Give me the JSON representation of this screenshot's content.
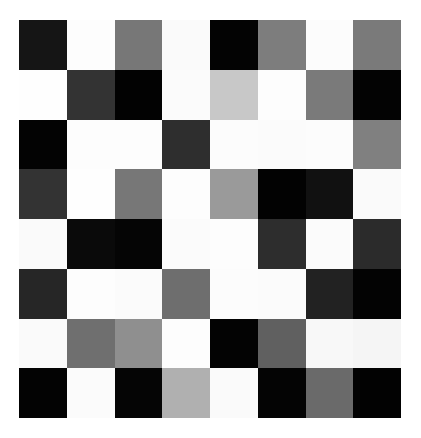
{
  "grid": {
    "rows": 8,
    "cols": 8,
    "cells": [
      [
        "#151515",
        "#fdfdfd",
        "#777777",
        "#fafafa",
        "#030303",
        "#7d7d7d",
        "#fcfcfc",
        "#7a7a7a"
      ],
      [
        "#fefefe",
        "#333333",
        "#020202",
        "#fbfbfb",
        "#c8c8c8",
        "#fdfdfd",
        "#7a7a7a",
        "#030303"
      ],
      [
        "#030303",
        "#fdfdfd",
        "#fdfdfd",
        "#2e2e2e",
        "#fcfcfc",
        "#fbfbfb",
        "#fcfcfc",
        "#808080"
      ],
      [
        "#333333",
        "#fefefe",
        "#777777",
        "#fdfdfd",
        "#9a9a9a",
        "#020202",
        "#111111",
        "#fafafa"
      ],
      [
        "#fafafa",
        "#0a0a0a",
        "#050505",
        "#fbfbfb",
        "#fdfdfd",
        "#2d2d2d",
        "#fbfbfb",
        "#2b2b2b"
      ],
      [
        "#262626",
        "#fdfdfd",
        "#fbfbfb",
        "#6e6e6e",
        "#fcfcfc",
        "#fbfbfb",
        "#222222",
        "#030303"
      ],
      [
        "#fafafa",
        "#6f6f6f",
        "#8f8f8f",
        "#fdfdfd",
        "#030303",
        "#606060",
        "#f8f8f8",
        "#f5f5f5"
      ],
      [
        "#030303",
        "#fbfbfb",
        "#050505",
        "#b0b0b0",
        "#fafafa",
        "#040404",
        "#6a6a6a",
        "#020202"
      ]
    ]
  }
}
